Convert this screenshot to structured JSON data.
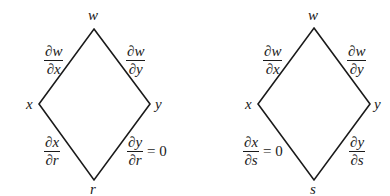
{
  "diagrams": [
    {
      "nodes": {
        "top": "w",
        "left": "x",
        "right": "y",
        "bottom": "r"
      },
      "edges": {
        "top_left": {
          "num": "∂w",
          "den": "∂x",
          "suffix": ""
        },
        "top_right": {
          "num": "∂w",
          "den": "∂y",
          "suffix": ""
        },
        "bottom_left": {
          "num": "∂x",
          "den": "∂r",
          "suffix": ""
        },
        "bottom_right": {
          "num": "∂y",
          "den": "∂r",
          "suffix": "= 0"
        }
      }
    },
    {
      "nodes": {
        "top": "w",
        "left": "x",
        "right": "y",
        "bottom": "s"
      },
      "edges": {
        "top_left": {
          "num": "∂w",
          "den": "∂x",
          "suffix": ""
        },
        "top_right": {
          "num": "∂w",
          "den": "∂y",
          "suffix": ""
        },
        "bottom_left": {
          "num": "∂x",
          "den": "∂s",
          "suffix": "= 0"
        },
        "bottom_right": {
          "num": "∂y",
          "den": "∂s",
          "suffix": ""
        }
      }
    }
  ],
  "colors": {
    "line": "#1a1a1a",
    "background": "#ffffff"
  }
}
